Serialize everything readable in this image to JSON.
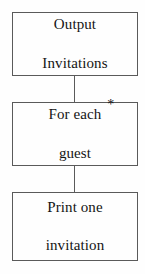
{
  "diagram": {
    "type": "flowchart",
    "background_color": "#fefefe",
    "border_color": "#5a5a5a",
    "text_color": "#141414",
    "nodes": [
      {
        "id": "output-invitations",
        "label": "Output\nInvitations",
        "line1": "Output",
        "line2": "Invitations",
        "shape": "rectangle"
      },
      {
        "id": "for-each-guest",
        "label": "For each guest",
        "line1": "For each",
        "line2": "guest",
        "shape": "rectangle",
        "annotation": "*",
        "annotation_name": "loop-asterisk"
      },
      {
        "id": "print-one-invitation",
        "label": "Print one\ninvitation",
        "line1": "Print one",
        "line2": "invitation",
        "shape": "rectangle"
      }
    ],
    "connectors": [
      {
        "id": "connector-1",
        "from": "output-invitations",
        "to": "for-each-guest",
        "style": "line"
      },
      {
        "id": "connector-2",
        "from": "for-each-guest",
        "to": "print-one-invitation",
        "style": "line"
      }
    ]
  }
}
